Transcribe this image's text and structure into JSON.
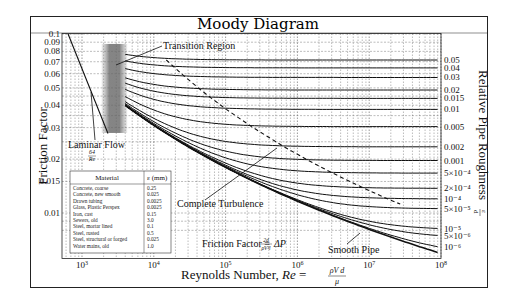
{
  "chart_data": {
    "type": "line",
    "title": "Moody Diagram",
    "xlabel": "Reynolds Number, Re = ρVd/μ",
    "ylabel": "Friction Factor",
    "ylabel_right": "Relative Pipe Roughness ε/d",
    "xscale": "log",
    "yscale": "log",
    "xlim": [
      500,
      100000000
    ],
    "ylim": [
      0.0078,
      0.1
    ],
    "grid": true,
    "x_ticks": [
      "10^3",
      "10^4",
      "10^5",
      "10^6",
      "10^7",
      "10^8"
    ],
    "x_tick_values": [
      1000,
      10000,
      100000,
      1000000,
      10000000,
      100000000
    ],
    "y_ticks": [
      "0.1",
      "0.09",
      "0.08",
      "0.07",
      "0.06",
      "0.05",
      "0.04",
      "0.03",
      "0.02",
      "0.015",
      "0.01"
    ],
    "y_tick_values": [
      0.1,
      0.09,
      0.08,
      0.07,
      0.06,
      0.05,
      0.04,
      0.03,
      0.02,
      0.015,
      0.01
    ],
    "right_ticks": [
      "0.05",
      "0.04",
      "0.03",
      "0.02",
      "0.015",
      "0.01",
      "0.005",
      "0.002",
      "0.001",
      "5×10⁻⁴",
      "2×10⁻⁴",
      "10⁻⁴",
      "5×10⁻⁵",
      "10⁻⁵",
      "5×10⁻⁶",
      "10⁻⁶"
    ],
    "series": [
      {
        "name": "Laminar Flow 64/Re",
        "type": "laminar",
        "x": [
          640,
          2300
        ],
        "values": [
          0.1,
          0.0278
        ]
      },
      {
        "name": "ε/d = 0.05",
        "roughness": 0.05
      },
      {
        "name": "ε/d = 0.04",
        "roughness": 0.04
      },
      {
        "name": "ε/d = 0.03",
        "roughness": 0.03
      },
      {
        "name": "ε/d = 0.02",
        "roughness": 0.02
      },
      {
        "name": "ε/d = 0.015",
        "roughness": 0.015
      },
      {
        "name": "ε/d = 0.01",
        "roughness": 0.01
      },
      {
        "name": "ε/d = 0.005",
        "roughness": 0.005
      },
      {
        "name": "ε/d = 0.002",
        "roughness": 0.002
      },
      {
        "name": "ε/d = 0.001",
        "roughness": 0.001
      },
      {
        "name": "ε/d = 5×10⁻⁴",
        "roughness": 0.0005
      },
      {
        "name": "ε/d = 2×10⁻⁴",
        "roughness": 0.0002
      },
      {
        "name": "ε/d = 10⁻⁴",
        "roughness": 0.0001
      },
      {
        "name": "ε/d = 5×10⁻⁵",
        "roughness": 5e-05
      },
      {
        "name": "ε/d = 10⁻⁵",
        "roughness": 1e-05
      },
      {
        "name": "ε/d = 5×10⁻⁶",
        "roughness": 5e-06
      },
      {
        "name": "ε/d = 10⁻⁶",
        "roughness": 1e-06
      },
      {
        "name": "Smooth Pipe",
        "roughness": 0
      }
    ],
    "annotations": [
      "Transition Region",
      "Laminar Flow",
      "64/Re",
      "Complete Turbulence",
      "Smooth Pipe",
      "Friction Factor = 2d/(ρV²l) ΔP"
    ],
    "transition_band_re": [
      2000,
      4000
    ]
  },
  "labels": {
    "title": "Moody Diagram",
    "xlabel_text": "Reynolds Number, ",
    "xlabel_re": "Re",
    "xlabel_num": "ρV d",
    "xlabel_den": "μ",
    "ylabel": "Friction Factor",
    "ylabel_right": "Relative Pipe Roughness",
    "ylabel_right_eps": "ε",
    "ylabel_right_d": "d",
    "transition": "Transition Region",
    "laminar": "Laminar Flow",
    "laminar_num": "64",
    "laminar_den": "Re",
    "complete": "Complete Turbulence",
    "smooth": "Smooth Pipe",
    "ff_text": "Friction Factor = ",
    "ff_num": "2d",
    "ff_den": "ρV²l",
    "ff_tail": "ΔP"
  },
  "materials_table": {
    "headers": [
      "Material",
      "ε (mm)"
    ],
    "rows": [
      [
        "Concrete, coarse",
        "0.25"
      ],
      [
        "Concrete, new smooth",
        "0.025"
      ],
      [
        "Drawn tubing",
        "0.0025"
      ],
      [
        "Glass, Plastic Perspex",
        "0.0025"
      ],
      [
        "Iron, cast",
        "0.15"
      ],
      [
        "Sewers, old",
        "3.0"
      ],
      [
        "Steel, mortar lined",
        "0.1"
      ],
      [
        "Steel, rusted",
        "0.5"
      ],
      [
        "Steel, structural or forged",
        "0.025"
      ],
      [
        "Water mains, old",
        "1.0"
      ]
    ]
  }
}
